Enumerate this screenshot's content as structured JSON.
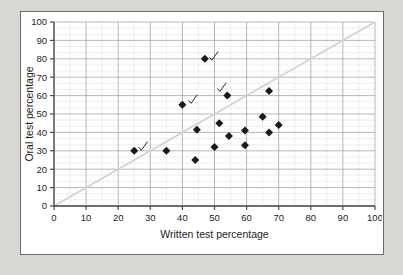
{
  "figure": {
    "background_color": "#d7d7d3",
    "panel_color": "#ffffff",
    "border_color": "#6b6b6b",
    "top_sliver_text": ""
  },
  "chart_data": {
    "type": "scatter",
    "title": "",
    "xlabel": "Written test percentage",
    "ylabel": "Oral test percentage",
    "xlim": [
      0,
      100
    ],
    "ylim": [
      0,
      100
    ],
    "xticks": [
      0,
      10,
      20,
      30,
      40,
      50,
      60,
      70,
      80,
      90,
      100
    ],
    "yticks": [
      0,
      10,
      20,
      30,
      40,
      50,
      60,
      70,
      80,
      90,
      100
    ],
    "grid": true,
    "minor_grid": true,
    "legend": "none",
    "marker": "diamond",
    "marker_color": "#1a1a1a",
    "reference_line": {
      "label": "y = x",
      "from": [
        0,
        0
      ],
      "to": [
        100,
        100
      ],
      "color": "#d2d2cd",
      "style": "solid"
    },
    "points": [
      {
        "x": 25,
        "y": 30
      },
      {
        "x": 35,
        "y": 30
      },
      {
        "x": 40,
        "y": 55
      },
      {
        "x": 44,
        "y": 25
      },
      {
        "x": 44.5,
        "y": 41.5
      },
      {
        "x": 47,
        "y": 80
      },
      {
        "x": 50,
        "y": 32
      },
      {
        "x": 51.5,
        "y": 45
      },
      {
        "x": 54,
        "y": 60
      },
      {
        "x": 54.5,
        "y": 38
      },
      {
        "x": 59.5,
        "y": 33
      },
      {
        "x": 59.5,
        "y": 41
      },
      {
        "x": 65,
        "y": 48.5
      },
      {
        "x": 67,
        "y": 40
      },
      {
        "x": 67,
        "y": 62.5
      },
      {
        "x": 70,
        "y": 44
      }
    ],
    "annotations": [
      {
        "type": "check-mark",
        "note": "hand-drawn tick",
        "x": 27.5,
        "y": 32
      },
      {
        "type": "check-mark",
        "note": "hand-drawn tick",
        "x": 43,
        "y": 57.5
      },
      {
        "type": "check-mark",
        "note": "hand-drawn tick",
        "x": 49.5,
        "y": 81
      },
      {
        "type": "check-mark",
        "note": "hand-drawn tick",
        "x": 52,
        "y": 64
      }
    ]
  }
}
